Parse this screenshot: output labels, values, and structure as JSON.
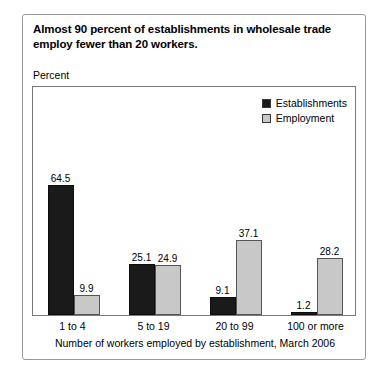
{
  "card": {
    "title": "Almost 90 percent of establishments in wholesale trade employ fewer than 20 workers.",
    "percent_label": "Percent",
    "x_axis_title": "Number of workers employed by establishment, March 2006"
  },
  "colors": {
    "establishments": "#1a1a1a",
    "employment": "#c8c8c8",
    "frame": "#7a7a7a",
    "card_border": "#999999",
    "background": "#ffffff",
    "text": "#000000"
  },
  "legend": {
    "items": [
      {
        "label": "Establishments",
        "swatch": "#1a1a1a"
      },
      {
        "label": "Employment",
        "swatch": "#c8c8c8"
      }
    ]
  },
  "chart_data": {
    "type": "bar",
    "title": "Almost 90 percent of establishments in wholesale trade employ fewer than 20 workers.",
    "xlabel": "Number of workers employed by establishment, March 2006",
    "ylabel": "Percent",
    "ylim": [
      0,
      70
    ],
    "grid": false,
    "legend_position": "top-right",
    "categories": [
      "1 to 4",
      "5 to 19",
      "20 to 99",
      "100 or more"
    ],
    "series": [
      {
        "name": "Establishments",
        "color": "#1a1a1a",
        "values": [
          64.5,
          25.1,
          9.1,
          1.2
        ]
      },
      {
        "name": "Employment",
        "color": "#c8c8c8",
        "values": [
          9.9,
          24.9,
          37.1,
          28.2
        ]
      }
    ],
    "value_labels": {
      "Establishments": [
        "64.5",
        "25.1",
        "9.1",
        "1.2"
      ],
      "Employment": [
        "9.9",
        "24.9",
        "37.1",
        "28.2"
      ]
    }
  }
}
